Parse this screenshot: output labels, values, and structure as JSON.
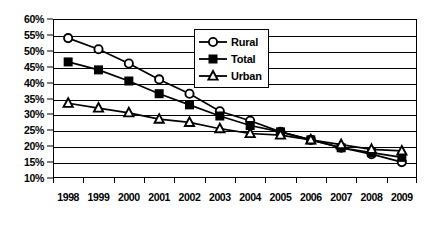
{
  "chart_data": {
    "type": "line",
    "title": "",
    "xlabel": "",
    "ylabel": "",
    "grid": true,
    "legend_position": "top-center",
    "categories": [
      "1998",
      "1999",
      "2000",
      "2001",
      "2002",
      "2003",
      "2004",
      "2005",
      "2006",
      "2007",
      "2008",
      "2009"
    ],
    "x": [
      1998,
      1999,
      2000,
      2001,
      2002,
      2003,
      2004,
      2005,
      2006,
      2007,
      2008,
      2009
    ],
    "ylim": [
      10,
      60
    ],
    "ytick_step": 5,
    "ytick_labels": [
      "60%",
      "55%",
      "50%",
      "45%",
      "40%",
      "35%",
      "30%",
      "25%",
      "20%",
      "15%",
      "10%"
    ],
    "ytick_values": [
      60,
      55,
      50,
      45,
      40,
      35,
      30,
      25,
      20,
      15,
      10
    ],
    "yunit": "%",
    "series": [
      {
        "name": "Rural",
        "marker": "open-circle",
        "color": "#000000",
        "values": [
          54.0,
          50.5,
          46.0,
          41.0,
          36.5,
          31.0,
          28.0,
          24.5,
          22.0,
          19.5,
          17.5,
          15.0
        ]
      },
      {
        "name": "Total",
        "marker": "filled-square",
        "color": "#000000",
        "values": [
          46.5,
          44.0,
          40.5,
          36.5,
          33.0,
          29.5,
          26.5,
          24.5,
          22.0,
          19.5,
          18.0,
          16.5
        ]
      },
      {
        "name": "Urban",
        "marker": "open-triangle",
        "color": "#000000",
        "values": [
          33.5,
          32.0,
          30.5,
          28.5,
          27.5,
          25.5,
          24.0,
          23.5,
          22.0,
          20.5,
          19.0,
          18.5
        ]
      }
    ]
  },
  "legend": {
    "items": [
      {
        "label": "Rural"
      },
      {
        "label": "Total"
      },
      {
        "label": "Urban"
      }
    ]
  }
}
